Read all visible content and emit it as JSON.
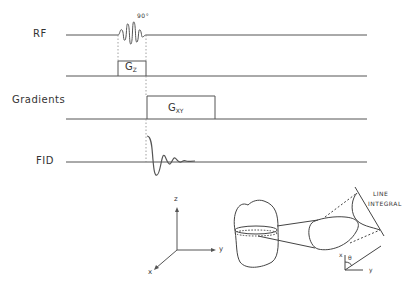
{
  "timing_diagram": {
    "rows": [
      {
        "label": "RF",
        "annotation": "90°"
      },
      {
        "label": "",
        "pulse_label": "G",
        "pulse_sub": "Z"
      },
      {
        "label": "Gradients",
        "pulse_label": "G",
        "pulse_sub": "XY"
      },
      {
        "label": "FID"
      }
    ]
  },
  "axes": {
    "z": "z",
    "y": "y",
    "x": "x"
  },
  "projection": {
    "line_integral_1": "LINE",
    "line_integral_2": "INTEGRAL",
    "angle": "θ",
    "axis_x": "x",
    "axis_y": "y"
  },
  "colors": {
    "line": "#555555",
    "text": "#333333"
  }
}
